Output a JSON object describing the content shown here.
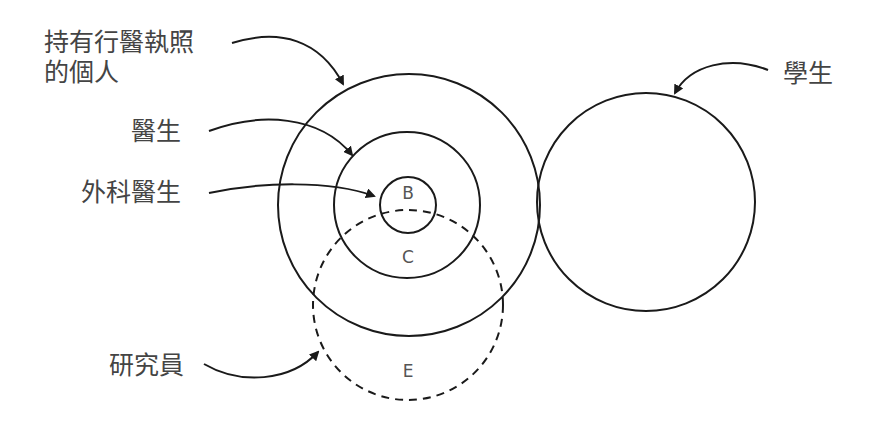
{
  "diagram": {
    "type": "venn-euler",
    "labels": {
      "licensed": [
        "持有行醫執照",
        "的個人"
      ],
      "doctor": "醫生",
      "surgeon": "外科醫生",
      "researcher": "研究員",
      "student": "學生"
    },
    "regions": {
      "b": "B",
      "c": "C",
      "e": "E"
    },
    "circles": [
      {
        "name": "licensed-individuals",
        "cx": 409,
        "cy": 205,
        "r": 131,
        "style": "solid"
      },
      {
        "name": "doctors",
        "cx": 407,
        "cy": 205,
        "r": 73,
        "style": "solid"
      },
      {
        "name": "surgeons",
        "cx": 408,
        "cy": 205,
        "r": 28,
        "style": "solid"
      },
      {
        "name": "researchers",
        "cx": 408,
        "cy": 305,
        "r": 95,
        "style": "dashed"
      },
      {
        "name": "students",
        "cx": 646,
        "cy": 202,
        "r": 109,
        "style": "solid"
      }
    ],
    "colors": {
      "stroke": "#1a1a1a",
      "text": "#444444",
      "background": "#ffffff"
    }
  }
}
